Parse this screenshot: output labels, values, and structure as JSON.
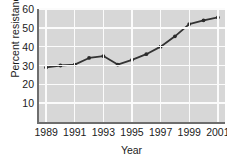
{
  "chart_data": {
    "type": "line",
    "title": "",
    "xlabel": "Year",
    "ylabel": "Percent resistance",
    "x": [
      1989,
      1990,
      1991,
      1992,
      1993,
      1994,
      1995,
      1996,
      1997,
      1998,
      1999,
      2000,
      2001
    ],
    "values": [
      29,
      30,
      30.5,
      34,
      35,
      30.5,
      33,
      36,
      40,
      45.5,
      52,
      54,
      55.5
    ],
    "series": [
      {
        "name": "Percent resistance",
        "values": [
          29,
          30,
          30.5,
          34,
          35,
          30.5,
          33,
          36,
          40,
          45.5,
          52,
          54,
          55.5
        ]
      }
    ],
    "xlim": [
      1988.5,
      2001.5
    ],
    "ylim": [
      0,
      60
    ],
    "xticks": [
      1989,
      1991,
      1993,
      1995,
      1997,
      1999,
      2001
    ],
    "xtick_labels": [
      "1989",
      "1991",
      "1993",
      "1995",
      "1997",
      "1999",
      "2001"
    ],
    "yticks": [
      10,
      20,
      30,
      40,
      50,
      60
    ],
    "ytick_labels": [
      "10",
      "20",
      "30",
      "40",
      "50",
      "60"
    ],
    "grid": true,
    "grid_color": "#fbfbfb",
    "plot_background": "#d7d7d7",
    "line_color": "#333333",
    "marker": "circle",
    "marker_color": "#2b2b2b",
    "legend": null,
    "legend_position": "none"
  }
}
